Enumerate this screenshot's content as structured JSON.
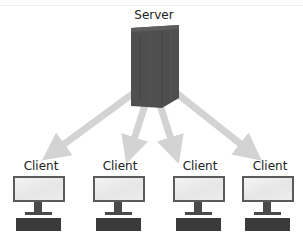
{
  "diagram": {
    "server": {
      "label": "Server",
      "icon": "server-tower-icon",
      "color": "#4a4a4a"
    },
    "arrow_color": "#d3d3d3",
    "clients": [
      {
        "label": "Client",
        "icon": "desktop-computer-icon"
      },
      {
        "label": "Client",
        "icon": "desktop-computer-icon"
      },
      {
        "label": "Client",
        "icon": "desktop-computer-icon"
      },
      {
        "label": "Client",
        "icon": "desktop-computer-icon"
      }
    ],
    "edges": [
      {
        "from": "Server",
        "to": "Client 1"
      },
      {
        "from": "Server",
        "to": "Client 2"
      },
      {
        "from": "Server",
        "to": "Client 3"
      },
      {
        "from": "Server",
        "to": "Client 4"
      }
    ]
  }
}
